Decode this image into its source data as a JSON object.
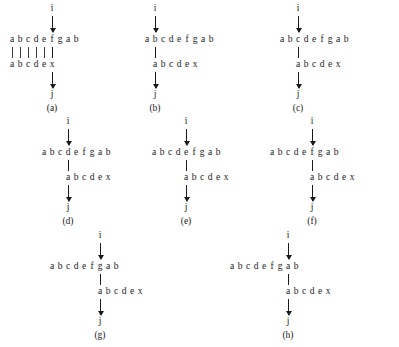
{
  "figure": {
    "top_sequence": [
      "a",
      "b",
      "c",
      "d",
      "e",
      "f",
      "g",
      "a",
      "b"
    ],
    "bottom_sequence": [
      "a",
      "b",
      "c",
      "d",
      "e",
      "x"
    ],
    "source_node": "i",
    "sink_node": "j",
    "char_width_px": 8,
    "ink_color": "#1a1a1a",
    "background_color": "#ffffff"
  },
  "panels": [
    {
      "id": "a",
      "label": "(a)",
      "top_node": "i",
      "bottom_node": "j",
      "top_sequence": [
        "a",
        "b",
        "c",
        "d",
        "e",
        "f",
        "g",
        "a",
        "b"
      ],
      "bottom_sequence": [
        "a",
        "b",
        "c",
        "d",
        "e",
        "x"
      ],
      "link_index": 5,
      "bottom_offset_chars": 0,
      "extra_tick_count": 5
    },
    {
      "id": "b",
      "label": "(b)",
      "top_node": "i",
      "bottom_node": "j",
      "top_sequence": [
        "a",
        "b",
        "c",
        "d",
        "e",
        "f",
        "g",
        "a",
        "b"
      ],
      "bottom_sequence": [
        "a",
        "b",
        "c",
        "d",
        "e",
        "x"
      ],
      "link_index": 1,
      "bottom_offset_chars": 1,
      "extra_tick_count": 0
    },
    {
      "id": "c",
      "label": "(c)",
      "top_node": "i",
      "bottom_node": "j",
      "top_sequence": [
        "a",
        "b",
        "c",
        "d",
        "e",
        "f",
        "g",
        "a",
        "b"
      ],
      "bottom_sequence": [
        "a",
        "b",
        "c",
        "d",
        "e",
        "x"
      ],
      "link_index": 2,
      "bottom_offset_chars": 2,
      "extra_tick_count": 0
    },
    {
      "id": "d",
      "label": "(d)",
      "top_node": "i",
      "bottom_node": "j",
      "top_sequence": [
        "a",
        "b",
        "c",
        "d",
        "e",
        "f",
        "g",
        "a",
        "b"
      ],
      "bottom_sequence": [
        "a",
        "b",
        "c",
        "d",
        "e",
        "x"
      ],
      "link_index": 3,
      "bottom_offset_chars": 3,
      "extra_tick_count": 0
    },
    {
      "id": "e",
      "label": "(e)",
      "top_node": "i",
      "bottom_node": "j",
      "top_sequence": [
        "a",
        "b",
        "c",
        "d",
        "e",
        "f",
        "g",
        "a",
        "b"
      ],
      "bottom_sequence": [
        "a",
        "b",
        "c",
        "d",
        "e",
        "x"
      ],
      "link_index": 4,
      "bottom_offset_chars": 4,
      "extra_tick_count": 0
    },
    {
      "id": "f",
      "label": "(f)",
      "top_node": "i",
      "bottom_node": "j",
      "top_sequence": [
        "a",
        "b",
        "c",
        "d",
        "e",
        "f",
        "g",
        "a",
        "b"
      ],
      "bottom_sequence": [
        "a",
        "b",
        "c",
        "d",
        "e",
        "x"
      ],
      "link_index": 5,
      "bottom_offset_chars": 5,
      "extra_tick_count": 0
    },
    {
      "id": "g",
      "label": "(g)",
      "top_node": "i",
      "bottom_node": "j",
      "top_sequence": [
        "a",
        "b",
        "c",
        "d",
        "e",
        "f",
        "g",
        "a",
        "b"
      ],
      "bottom_sequence": [
        "a",
        "b",
        "c",
        "d",
        "e",
        "x"
      ],
      "link_index": 6,
      "bottom_offset_chars": 6,
      "extra_tick_count": 0
    },
    {
      "id": "h",
      "label": "(h)",
      "top_node": "i",
      "bottom_node": "j",
      "top_sequence": [
        "a",
        "b",
        "c",
        "d",
        "e",
        "f",
        "g",
        "a",
        "b"
      ],
      "bottom_sequence": [
        "a",
        "b",
        "c",
        "d",
        "e",
        "x"
      ],
      "link_index": 7,
      "bottom_offset_chars": 7,
      "extra_tick_count": 0
    }
  ],
  "layout": {
    "panel_positions": [
      {
        "id": "a",
        "left": 8,
        "top": 4
      },
      {
        "id": "b",
        "left": 143,
        "top": 4
      },
      {
        "id": "c",
        "left": 278,
        "top": 4
      },
      {
        "id": "d",
        "left": 40,
        "top": 117
      },
      {
        "id": "e",
        "left": 150,
        "top": 117
      },
      {
        "id": "f",
        "left": 268,
        "top": 117
      },
      {
        "id": "g",
        "left": 48,
        "top": 231
      },
      {
        "id": "h",
        "left": 228,
        "top": 231
      }
    ]
  }
}
